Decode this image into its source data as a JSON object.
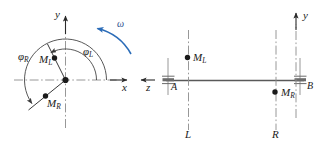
{
  "figure": {
    "colors": {
      "line": "#4d4d4d",
      "centerline": "#808080",
      "axis": "#333333",
      "omega": "#2b6cb8",
      "text": "#1a1a1a",
      "background": "#ffffff"
    }
  },
  "left_view": {
    "name": "end-view",
    "axes": {
      "y_label": "y",
      "x_label": "x",
      "z_label": "z"
    },
    "angles": [
      {
        "id": "phi-L",
        "label": "φ",
        "subscript": "L",
        "description": "angle from x-axis to M_L"
      },
      {
        "id": "phi-R",
        "label": "φ",
        "subscript": "R",
        "description": "angle from x-axis to M_R"
      }
    ],
    "masses": [
      {
        "id": "mass-ML",
        "label": "M",
        "subscript": "L"
      },
      {
        "id": "mass-MR",
        "label": "M",
        "subscript": "R"
      }
    ],
    "rotation": {
      "label": "ω",
      "direction": "counterclockwise"
    }
  },
  "right_view": {
    "name": "side-view",
    "axes": {
      "y_label": "y"
    },
    "bearings": [
      {
        "id": "bearing-A",
        "label": "A"
      },
      {
        "id": "bearing-B",
        "label": "B"
      }
    ],
    "masses": [
      {
        "id": "mass-ML",
        "label": "M",
        "subscript": "L"
      },
      {
        "id": "mass-MR",
        "label": "M",
        "subscript": "R"
      }
    ],
    "planes": [
      {
        "id": "plane-L",
        "label": "L"
      },
      {
        "id": "plane-R",
        "label": "R"
      }
    ]
  }
}
